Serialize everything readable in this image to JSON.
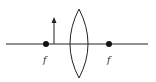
{
  "diagram": {
    "type": "optics-converging-lens",
    "colors": {
      "line": "#222222",
      "background": "#ffffff"
    },
    "principal_axis": {
      "x1": 6,
      "x2": 148,
      "y": 44
    },
    "lens": {
      "shape": "biconvex",
      "center_x": 79,
      "top_y": 9,
      "bottom_y": 78,
      "half_width": 9
    },
    "focal_points": [
      {
        "label": "f",
        "x": 46,
        "y": 44,
        "side": "left"
      },
      {
        "label": "f",
        "x": 109,
        "y": 44,
        "side": "right"
      }
    ],
    "object_arrow": {
      "x": 54,
      "base_y": 44,
      "tip_y": 19,
      "direction": "up"
    },
    "labels": {
      "left_focal": "f",
      "right_focal": "f"
    }
  }
}
